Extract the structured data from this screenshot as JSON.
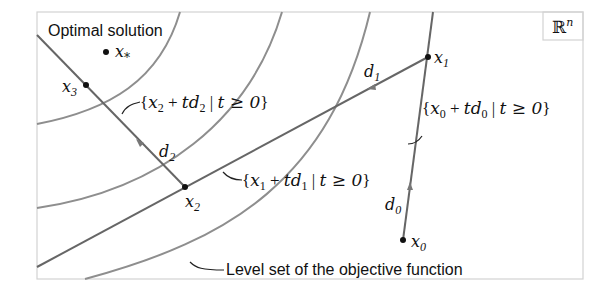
{
  "diagram": {
    "space_label": "ℝ",
    "space_superscript": "n",
    "optimal_label": "Optimal solution",
    "level_set_label": "Level set of the objective function",
    "points": {
      "x_star": {
        "base": "x",
        "sub": "*"
      },
      "x0": {
        "base": "x",
        "sub": "0"
      },
      "x1": {
        "base": "x",
        "sub": "1"
      },
      "x2": {
        "base": "x",
        "sub": "2"
      },
      "x3": {
        "base": "x",
        "sub": "3"
      }
    },
    "directions": {
      "d0": {
        "base": "d",
        "sub": "0"
      },
      "d1": {
        "base": "d",
        "sub": "1"
      },
      "d2": {
        "base": "d",
        "sub": "2"
      }
    },
    "rays": {
      "r0": {
        "open": "{",
        "x": "x",
        "xs": "0",
        "plus": " + ",
        "t": "t",
        "d": "d",
        "ds": "0",
        "bar": " | ",
        "cond": "t ≥ 0",
        "close": "}"
      },
      "r1": {
        "open": "{",
        "x": "x",
        "xs": "1",
        "plus": " + ",
        "t": "t",
        "d": "d",
        "ds": "1",
        "bar": " | ",
        "cond": "t ≥ 0",
        "close": "}"
      },
      "r2": {
        "open": "{",
        "x": "x",
        "xs": "2",
        "plus": " + ",
        "t": "t",
        "d": "d",
        "ds": "2",
        "bar": " | ",
        "cond": "t ≥ 0",
        "close": "}"
      }
    },
    "colors": {
      "frame": "#d2d2d2",
      "level_curve": "#8e8e8e",
      "iterate_path": "#666666",
      "point": "#111111"
    }
  }
}
